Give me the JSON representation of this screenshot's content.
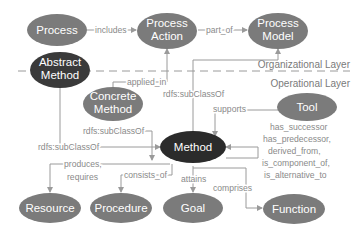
{
  "colors": {
    "node_gray": "#7b7b7b",
    "node_dark": "#2b2b2b",
    "edge": "#9a9a9a",
    "edge_label": "#8a8a8a",
    "layer_label": "#7a7a7a"
  },
  "layers": {
    "top": "Organizational Layer",
    "bottom": "Operational Layer"
  },
  "nodes": {
    "process": "Process",
    "process_action_1": "Process",
    "process_action_2": "Action",
    "process_model_1": "Process",
    "process_model_2": "Model",
    "abstract_method_1": "Abstract",
    "abstract_method_2": "Method",
    "concrete_method_1": "Concrete",
    "concrete_method_2": "Method",
    "tool": "Tool",
    "method": "Method",
    "resource": "Resource",
    "procedure": "Procedure",
    "goal": "Goal",
    "function": "Function"
  },
  "edges": {
    "includes": "includes",
    "part_of": "part_of",
    "applied_in": "applied_in",
    "subclass_concrete_action": "rdfs:subClassOf",
    "subclass_concrete_method": "rdfs:subClassOf",
    "subclass_abstract_method": "rdfs:subClassOf",
    "supports": "supports",
    "self_relations": [
      "has_successor",
      "has_predecessor,",
      "derived_from,",
      "is_component_of,",
      "is_alternative_to"
    ],
    "produces_1": "produces,",
    "produces_2": "requires",
    "consists_of": "consists_of",
    "attains": "attains",
    "comprises": "comprises"
  }
}
